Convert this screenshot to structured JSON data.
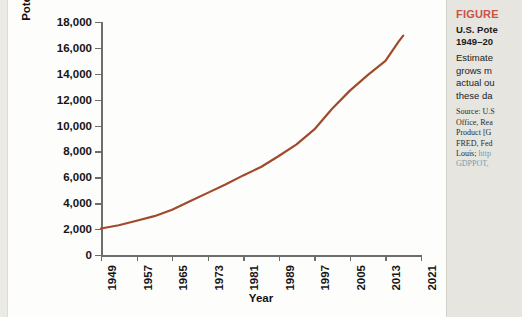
{
  "chart_data": {
    "type": "line",
    "title": "",
    "xlabel": "Year",
    "ylabel": "Potential GDP (2009 dollars, billions)",
    "xlim": [
      1949,
      2021
    ],
    "ylim": [
      0,
      18000
    ],
    "grid": false,
    "legend": "none",
    "line_color": "#A04A2B",
    "x_ticks": [
      "1949",
      "1957",
      "1965",
      "1973",
      "1981",
      "1989",
      "1997",
      "2005",
      "2013",
      "2021"
    ],
    "y_ticks": [
      "0",
      "2,000",
      "4,000",
      "6,000",
      "8,000",
      "10,000",
      "12,000",
      "14,000",
      "16,000",
      "18,000"
    ],
    "series": [
      {
        "name": "Potential GDP",
        "x": [
          1949,
          1953,
          1957,
          1961,
          1965,
          1969,
          1973,
          1977,
          1981,
          1985,
          1989,
          1993,
          1997,
          2001,
          2005,
          2009,
          2013,
          2016,
          2017
        ],
        "values": [
          2050,
          2300,
          2650,
          3000,
          3500,
          4150,
          4800,
          5450,
          6150,
          6800,
          7650,
          8550,
          9700,
          11300,
          12700,
          13900,
          15000,
          16500,
          16950
        ]
      }
    ]
  },
  "caption": {
    "kicker": "FIGURE",
    "title_line_1": "U.S. Pote",
    "title_line_2": "1949–20",
    "body_line_1": "Estimate",
    "body_line_2": "grows m",
    "body_line_3": "actual ou",
    "body_line_4": "these da",
    "source_line_1": "Source: U.S",
    "source_line_2": "Office, Rea",
    "source_line_3": "Product [G",
    "source_line_4": "FRED, Fed",
    "source_line_5_text": "Louis;",
    "source_line_5_link": "http",
    "source_line_6_link": "GDPPOT,",
    "kicker_color": "#c6544a",
    "link_color": "#6f9fb0"
  }
}
